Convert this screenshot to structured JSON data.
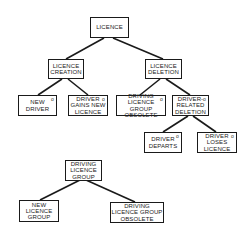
{
  "diagram": {
    "type": "structure-tree",
    "trees": [
      {
        "root": "licence",
        "nodes": [
          {
            "id": "licence",
            "label": "LICENCE",
            "marker": "",
            "children": [
              "licence_creation",
              "licence_deletion"
            ]
          },
          {
            "id": "licence_creation",
            "label": "LICENCE\nCREATION",
            "marker": "",
            "children": [
              "new_driver",
              "driver_gains_new_licence"
            ]
          },
          {
            "id": "licence_deletion",
            "label": "LICENCE\nDELETION",
            "marker": "",
            "children": [
              "driving_licence_group_obsolete",
              "driver_related_deletion"
            ]
          },
          {
            "id": "new_driver",
            "label": "NEW\nDRIVER",
            "marker": "o",
            "children": []
          },
          {
            "id": "driver_gains_new_licence",
            "label": "DRIVER\nGAINS NEW\nLICENCE",
            "marker": "o",
            "children": []
          },
          {
            "id": "driving_licence_group_obsolete",
            "label": "DRIVING\nLICENCE GROUP\nOBSOLETE",
            "marker": "o",
            "children": []
          },
          {
            "id": "driver_related_deletion",
            "label": "DRIVER-\nRELATED\nDELETION",
            "marker": "o",
            "children": [
              "driver_departs",
              "driver_loses_licence"
            ]
          },
          {
            "id": "driver_departs",
            "label": "DRIVER\nDEPARTS",
            "marker": "o",
            "children": []
          },
          {
            "id": "driver_loses_licence",
            "label": "DRIVER\nLOSES\nLICENCE",
            "marker": "o",
            "children": []
          }
        ]
      },
      {
        "root": "driving_licence_group",
        "nodes": [
          {
            "id": "driving_licence_group",
            "label": "DRIVING\nLICENCE\nGROUP",
            "marker": "",
            "children": [
              "new_licence_group",
              "dlg_obsolete_2"
            ]
          },
          {
            "id": "new_licence_group",
            "label": "NEW\nLICENCE\nGROUP",
            "marker": "",
            "children": []
          },
          {
            "id": "dlg_obsolete_2",
            "label": "DRIVING\nLICENCE GROUP\nOBSOLETE",
            "marker": "",
            "children": []
          }
        ]
      }
    ]
  },
  "colors": {
    "line": "#1a1a1a",
    "background": "#ffffff",
    "text": "#222222"
  }
}
